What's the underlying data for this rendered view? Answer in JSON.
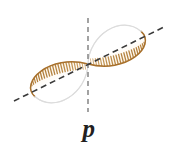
{
  "figure": {
    "kind": "p-orbital-diagram",
    "caption_label": "p",
    "width": 178,
    "height": 153,
    "background_color": "#ffffff"
  },
  "colors": {
    "hatch_light": "#e8c79a",
    "hatch_mid": "#c8913f",
    "hatch_dark": "#a8702b",
    "lobe_outline": "#b4843a",
    "lobe_outline_faint": "#e2e2e2",
    "lobe_fill": "#ffffff",
    "vertical_dash": "#8c8c8c",
    "diagonal_dash": "#3a3a3a",
    "label_text": "#231f20"
  },
  "axes": {
    "vertical_nodal_line": {
      "name": "vertical-dashed-nodal-line",
      "x": 88,
      "y_top": 18,
      "y_bottom": 112,
      "dash_pattern": "5,4",
      "stroke_width": 1.6,
      "color": "#8c8c8c"
    },
    "diagonal_axis_line": {
      "name": "diagonal-dashed-axis-line",
      "x1": 14,
      "y1": 101,
      "x2": 166,
      "y2": 26,
      "angle_degrees": -26,
      "dash_pattern": "6,4",
      "stroke_width": 1.6,
      "color": "#3a3a3a"
    },
    "origin": {
      "x": 88,
      "y": 64
    }
  },
  "lobes": [
    {
      "name": "upper-right-lobe",
      "orientation": "upper-right",
      "tip": {
        "x": 88,
        "y": 64
      },
      "bulb_center": {
        "x": 126,
        "y": 40
      },
      "bounds": {
        "x": 88,
        "y": 19,
        "width": 62,
        "height": 45
      },
      "rotation_degrees": -26,
      "hatch_count": 30,
      "hatch_side": "lower-outer"
    },
    {
      "name": "lower-left-lobe",
      "orientation": "lower-left",
      "tip": {
        "x": 88,
        "y": 64
      },
      "bulb_center": {
        "x": 50,
        "y": 88
      },
      "bounds": {
        "x": 26,
        "y": 64,
        "width": 62,
        "height": 45
      },
      "rotation_degrees": 154,
      "hatch_count": 30,
      "hatch_side": "lower-outer"
    }
  ]
}
